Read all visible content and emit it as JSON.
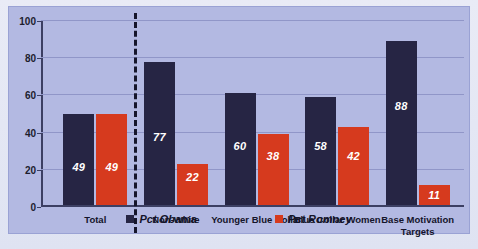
{
  "chart_data": {
    "type": "bar",
    "title": "",
    "subtitle": "",
    "xlabel": "",
    "ylabel": "",
    "ylim": [
      0,
      100
    ],
    "yticks": [
      0,
      20,
      40,
      60,
      80,
      100
    ],
    "grid": true,
    "legend_position": "bottom",
    "categories": [
      "Total",
      "Non-White",
      "Younger Blue Collar",
      "Blue Collar Women",
      "Base Motivation Targets"
    ],
    "series": [
      {
        "name": "Pct Obama",
        "color": "#262544",
        "values": [
          49,
          77,
          60,
          58,
          88
        ]
      },
      {
        "name": "Pct Romney",
        "color": "#d63a1e",
        "values": [
          49,
          22,
          38,
          42,
          11
        ]
      }
    ],
    "annotations": {
      "divider_after_category": "Total",
      "divider_style": "dashed-vertical"
    },
    "colors": {
      "plot_background": "#b3b9e2",
      "page_background": "#e4e7f3",
      "gridline": "#9096c8",
      "axis": "#3c3f63",
      "data_label_text": "#ffffff"
    }
  }
}
